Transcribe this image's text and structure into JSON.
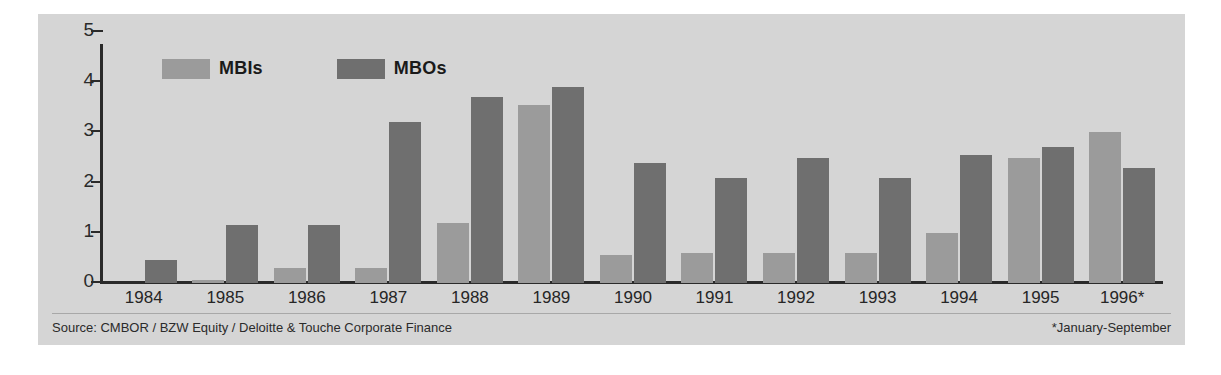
{
  "chart_data": {
    "type": "bar",
    "title": "",
    "xlabel": "",
    "ylabel": "",
    "ylim": [
      0,
      5
    ],
    "yticks": [
      "0",
      "1",
      "2",
      "3",
      "4",
      "5"
    ],
    "grid": false,
    "legend_position": "top-left",
    "categories": [
      "1984",
      "1985",
      "1986",
      "1987",
      "1988",
      "1989",
      "1990",
      "1991",
      "1992",
      "1993",
      "1994",
      "1995",
      "1996*"
    ],
    "series": [
      {
        "name": "MBIs",
        "color": "#9b9b9b",
        "values": [
          0,
          0.07,
          0.3,
          0.3,
          1.2,
          3.55,
          0.55,
          0.6,
          0.6,
          0.6,
          1.0,
          2.5,
          3.0
        ]
      },
      {
        "name": "MBOs",
        "color": "#6f6f6f",
        "values": [
          0.45,
          1.15,
          1.15,
          3.2,
          3.7,
          3.9,
          2.4,
          2.1,
          2.5,
          2.1,
          2.55,
          2.7,
          2.3
        ]
      }
    ],
    "annotations": {
      "source": "Source: CMBOR / BZW Equity / Deloitte & Touche Corporate Finance",
      "footnote": "*January-September"
    }
  },
  "legend": {
    "items": [
      {
        "label": "MBIs"
      },
      {
        "label": "MBOs"
      }
    ]
  },
  "footer": {
    "source": "Source: CMBOR / BZW Equity / Deloitte & Touche Corporate Finance",
    "note": "*January-September"
  },
  "colors": {
    "panel_background": "#d5d5d5",
    "axis": "#2a2a2a",
    "mbi": "#9b9b9b",
    "mbo": "#6f6f6f"
  }
}
